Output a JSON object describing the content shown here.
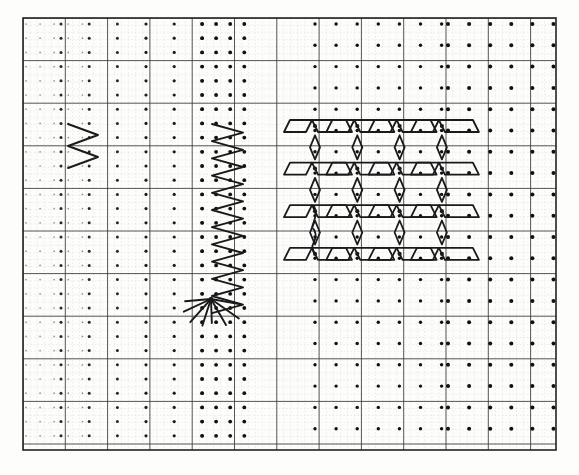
{
  "figure": {
    "background_color": "#fdfdfc",
    "ink_color": "#1a1a1a",
    "grid_minor_color": "#b9b9b9",
    "grid_major_color": "#3a3a3a",
    "border_color": "#222222",
    "dot_color": "#111111",
    "canvas": {
      "width": 579,
      "height": 475
    }
  },
  "plate": {
    "label": "plate-border",
    "x": 23,
    "y": 18,
    "width": 533,
    "height": 432,
    "border_width": 1.6
  },
  "grid": {
    "minor_step_x": 7.05,
    "minor_step_y": 7.1,
    "major_step_x": 42.3,
    "major_step_y": 42.6,
    "minor_line_width": 0.5,
    "major_line_width": 1.0,
    "minor_dash": "1.6 2.0",
    "major_dash": "none",
    "minor_opacity": 0.55
  },
  "dot_fields": [
    {
      "name": "left-sparse-field",
      "description": "faint wide-spaced dot lattice at far left",
      "x_start": 26,
      "x_step": 14.1,
      "x_count": 5,
      "y_start": 24,
      "y_step": 14.2,
      "y_count": 30,
      "radius": 0.85,
      "opacity": 0.45
    },
    {
      "name": "left-column-field",
      "description": "column of bold dots left of small zigzag",
      "x_start": 61,
      "x_step": 28.2,
      "x_count": 3,
      "y_start": 24,
      "y_step": 14.2,
      "y_count": 30,
      "radius": 1.5,
      "opacity": 0.9
    },
    {
      "name": "mid-sparse-field",
      "description": "medium dots between left and tall zigzag",
      "x_start": 146,
      "x_step": 28.2,
      "x_count": 3,
      "y_start": 24,
      "y_step": 14.2,
      "y_count": 30,
      "radius": 1.6,
      "opacity": 0.95
    },
    {
      "name": "zigzag-rail-field",
      "description": "dense bold dot rails flanking the tall zigzag",
      "x_start": 202,
      "x_step": 14.1,
      "x_count": 4,
      "y_start": 24,
      "y_step": 14.2,
      "y_count": 30,
      "radius": 1.9,
      "opacity": 1.0
    },
    {
      "name": "flower-lattice-field",
      "description": "lattice of nodes under the diamond-rosette motif",
      "x_start": 315,
      "x_step": 21.1,
      "x_count": 7,
      "y_start": 24,
      "y_step": 21.3,
      "y_count": 20,
      "radius": 1.7,
      "opacity": 1.0
    },
    {
      "name": "right-coarse-field",
      "description": "coarse bold dot lattice on the right third",
      "x_start": 448,
      "x_step": 21.1,
      "x_count": 6,
      "y_start": 24,
      "y_step": 21.3,
      "y_count": 20,
      "radius": 2.0,
      "opacity": 1.0
    }
  ],
  "motifs": {
    "small_zigzag": {
      "name": "small-zigzag",
      "description": "two-cycle horizontal-amplitude zigzag, upper left",
      "apex_left_x": 68,
      "apex_right_x": 98,
      "y_top": 124,
      "y_step": 11.0,
      "cycles": 2,
      "stroke_width": 1.9
    },
    "tall_zigzag": {
      "name": "tall-zigzag",
      "description": "eleven-cycle vertical zigzag column, center-left",
      "apex_left_x": 212,
      "apex_right_x": 243,
      "y_top": 124,
      "y_step": 8.6,
      "cycles": 11,
      "stroke_width": 1.9
    },
    "burst": {
      "name": "ray-burst",
      "description": "fan of straight rays radiating from the zigzag foot",
      "origin_x": 211,
      "origin_y": 299,
      "rays": [
        {
          "angle_deg": 185,
          "length": 26
        },
        {
          "angle_deg": 205,
          "length": 30
        },
        {
          "angle_deg": 228,
          "length": 31
        },
        {
          "angle_deg": 252,
          "length": 28
        },
        {
          "angle_deg": 272,
          "length": 24
        },
        {
          "angle_deg": 300,
          "length": 30
        },
        {
          "angle_deg": 325,
          "length": 34
        },
        {
          "angle_deg": 350,
          "length": 30
        }
      ],
      "stroke_width": 1.9
    },
    "rosette": {
      "name": "diamond-rosette",
      "description": "4x4 array of slanted parallelograms with upright diamonds between",
      "origin_x": 315,
      "origin_y": 126,
      "cell_x": 42.3,
      "cell_y": 42.6,
      "columns": 4,
      "rows": 4,
      "slanted_half_w": 14,
      "slanted_half_h": 6,
      "diamond_half_w": 5,
      "diamond_half_h": 12,
      "stroke_width": 1.8
    },
    "squiggle": {
      "name": "s-squiggle",
      "description": "small S-shaped wave at the left edge of the rosette",
      "x": 314,
      "y_top": 206,
      "y_bottom": 253,
      "amplitude": 6,
      "stroke_width": 1.8
    }
  },
  "legend": {
    "elements": [
      "plate-border",
      "minor-grid",
      "major-grid",
      "dot-lattice",
      "small-zigzag",
      "tall-zigzag",
      "ray-burst",
      "diamond-rosette",
      "s-squiggle"
    ]
  }
}
